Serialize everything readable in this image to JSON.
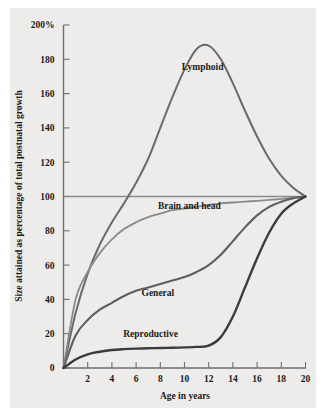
{
  "figure": {
    "background_color": "#eeecea",
    "page_color": "#ffffff",
    "axis_color": "#6e6e6e"
  },
  "chart_data": {
    "type": "line",
    "title": "",
    "xlabel": "Age in years",
    "ylabel": "Size attained as percentage of total postnatal growth",
    "xlim": [
      0,
      20
    ],
    "ylim": [
      0,
      200
    ],
    "grid": false,
    "legend_position": "inline-annotations",
    "x_ticks": [
      0,
      2,
      4,
      6,
      8,
      10,
      12,
      14,
      16,
      18,
      20
    ],
    "x_tick_labels": [
      "",
      "2",
      "4",
      "6",
      "8",
      "10",
      "12",
      "14",
      "16",
      "18",
      "20"
    ],
    "y_ticks": [
      0,
      20,
      40,
      60,
      80,
      100,
      120,
      140,
      160,
      180,
      200
    ],
    "y_tick_labels": [
      "0",
      "20",
      "40",
      "60",
      "80",
      "100",
      "120",
      "140",
      "160",
      "180",
      "200%"
    ],
    "reference_line_y": 100,
    "x": [
      0,
      1,
      2,
      3,
      4,
      5,
      6,
      7,
      8,
      9,
      10,
      11,
      12,
      13,
      14,
      15,
      16,
      17,
      18,
      19,
      20
    ],
    "series": [
      {
        "name": "Lymphoid",
        "color": "#6a6a6a",
        "width": 2.0,
        "label_x": 11.5,
        "label_y": 174,
        "values": [
          0,
          32,
          55,
          72,
          85,
          96,
          108,
          122,
          140,
          158,
          174,
          186,
          188,
          180,
          166,
          150,
          135,
          122,
          112,
          105,
          100
        ]
      },
      {
        "name": "Brain and head",
        "color": "#8a8a8a",
        "width": 1.8,
        "label_x": 10.4,
        "label_y": 93,
        "values": [
          0,
          40,
          56,
          67,
          75,
          81,
          85,
          88,
          90,
          92,
          93,
          94,
          95,
          96,
          96.5,
          97,
          97.5,
          98,
          98.6,
          99.3,
          100
        ]
      },
      {
        "name": "General",
        "color": "#5e5e5e",
        "width": 2.1,
        "label_x": 7.8,
        "label_y": 42,
        "values": [
          0,
          19,
          28,
          34,
          38,
          42,
          45,
          47,
          49,
          51,
          53,
          56,
          60,
          66,
          74,
          82,
          89,
          94,
          97,
          99,
          100
        ]
      },
      {
        "name": "Reproductive",
        "color": "#3c3c3c",
        "width": 2.4,
        "label_x": 7.2,
        "label_y": 18,
        "values": [
          0,
          5,
          8,
          9.5,
          10.5,
          11,
          11.3,
          11.5,
          11.7,
          11.8,
          12,
          12.3,
          13,
          18,
          30,
          47,
          64,
          79,
          90,
          96,
          100
        ]
      }
    ]
  }
}
